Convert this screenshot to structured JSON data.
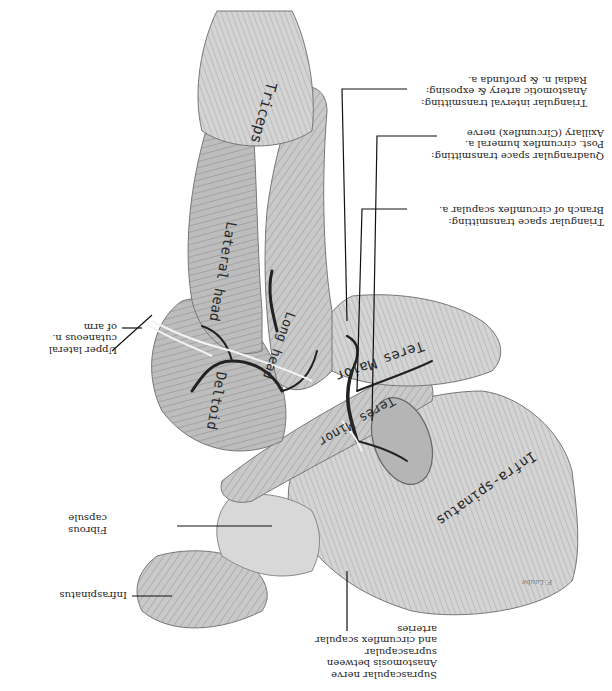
{
  "figure": {
    "orientation": "upside-down",
    "signature": "F. Laube"
  },
  "structures": {
    "triceps": "Triceps",
    "lateral_head": "Lateral head",
    "long_head": "Long head",
    "teres_major": "Teres Major",
    "teres_minor": "Teres Minor",
    "infraspinatus_muscle": "Infra-spinatus",
    "deltoid": "Deltoid"
  },
  "labels": {
    "triangular_interval": [
      "Triangular interval transmitting:",
      "Anastomotic artery & exposing:",
      "Radial n. & profunda a."
    ],
    "quadrangular_space": [
      "Quadrangular space transmitting:",
      "Post. circumflex humeral a.",
      "Axillary (Circumflex) nerve"
    ],
    "triangular_space": [
      "Triangular space transmitting:",
      "Branch of circumflex scapular a."
    ],
    "upper_lateral_cutaneous": [
      "Upper lateral",
      "cutaneous n.",
      "of arm"
    ],
    "fibrous_capsule": [
      "Fibrous",
      "capsule"
    ],
    "infraspinatus": [
      "Infraspinatus"
    ],
    "suprascapular": [
      "Suprascapular nerve",
      "Anastomosis between",
      "suprascapular",
      "and circumflex scapular",
      "arteries"
    ]
  }
}
